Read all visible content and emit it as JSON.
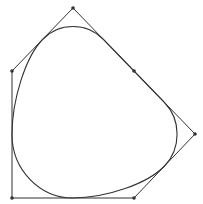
{
  "diagram": {
    "type": "closed-bspline-with-control-polygon",
    "stroke_color": "#333333",
    "background": "#ffffff",
    "control_points": [
      [
        73,
        8
      ],
      [
        134,
        71
      ],
      [
        195,
        134
      ],
      [
        134,
        198
      ],
      [
        12,
        198
      ],
      [
        12,
        71
      ]
    ],
    "marked_points": [
      [
        73,
        8
      ],
      [
        134,
        71
      ],
      [
        195,
        134
      ],
      [
        134,
        198
      ],
      [
        12,
        198
      ],
      [
        12,
        71
      ]
    ]
  }
}
